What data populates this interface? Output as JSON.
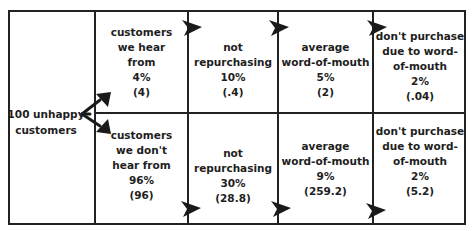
{
  "diagram": {
    "root": {
      "line1": "100 unhappy",
      "line2": "customers"
    },
    "top_row": [
      {
        "lines": [
          "customers",
          "we hear",
          "from"
        ],
        "percent": "4%",
        "count": "(4)"
      },
      {
        "lines": [
          "not",
          "repurchasing"
        ],
        "percent": "10%",
        "count": "(.4)"
      },
      {
        "lines": [
          "average",
          "word-of-mouth"
        ],
        "percent": "5%",
        "count": "(2)"
      },
      {
        "lines": [
          "don't purchase",
          "due to word-",
          "of-mouth"
        ],
        "percent": "2%",
        "count": "(.04)"
      }
    ],
    "bottom_row": [
      {
        "lines": [
          "customers",
          "we don't",
          "hear from"
        ],
        "percent": "96%",
        "count": "(96)"
      },
      {
        "lines": [
          "not",
          "repurchasing"
        ],
        "percent": "30%",
        "count": "(28.8)"
      },
      {
        "lines": [
          "average",
          "word-of-mouth"
        ],
        "percent": "9%",
        "count": "(259.2)"
      },
      {
        "lines": [
          "don't purchase",
          "due to word-",
          "of-mouth"
        ],
        "percent": "2%",
        "count": "(5.2)"
      }
    ],
    "icons": {
      "flow_arrow": "arrowhead-right-icon",
      "fork_arrow": "fork-arrow-icon"
    },
    "colors": {
      "line": "#222222",
      "text": "#1e1e1e",
      "background": "#ffffff"
    }
  }
}
